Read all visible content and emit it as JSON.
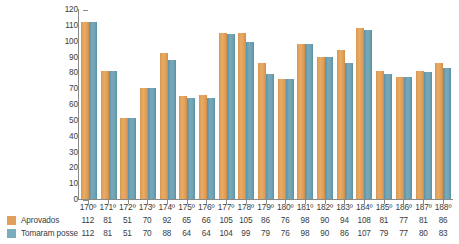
{
  "chart_data": {
    "type": "bar",
    "title": "",
    "subtitle": "",
    "xlabel": "",
    "ylabel": "",
    "ylim": [
      0,
      120
    ],
    "ytick_step": 10,
    "yticks": [
      120,
      110,
      100,
      90,
      80,
      70,
      60,
      50,
      40,
      30,
      20,
      10,
      0
    ],
    "grid": false,
    "legend_position": "bottom-left",
    "categories": [
      "170º",
      "171º",
      "172º",
      "173º",
      "174º",
      "175º",
      "176º",
      "177º",
      "178º",
      "179º",
      "180º",
      "181º",
      "182º",
      "183º",
      "184º",
      "185º",
      "186º",
      "187º",
      "188º"
    ],
    "series": [
      {
        "name": "Aprovados",
        "color": "#e0a05c",
        "values": [
          112,
          81,
          51,
          70,
          92,
          65,
          66,
          105,
          105,
          86,
          76,
          98,
          90,
          94,
          108,
          81,
          77,
          81,
          86
        ]
      },
      {
        "name": "Tomaram posse",
        "color": "#7bacbc",
        "values": [
          112,
          81,
          51,
          70,
          88,
          64,
          64,
          104,
          99,
          79,
          76,
          98,
          90,
          86,
          107,
          79,
          77,
          80,
          83
        ]
      }
    ]
  },
  "legend": {
    "items": [
      {
        "label": "Aprovados",
        "color": "#e0a05c"
      },
      {
        "label": "Tomaram posse",
        "color": "#7bacbc"
      }
    ]
  }
}
